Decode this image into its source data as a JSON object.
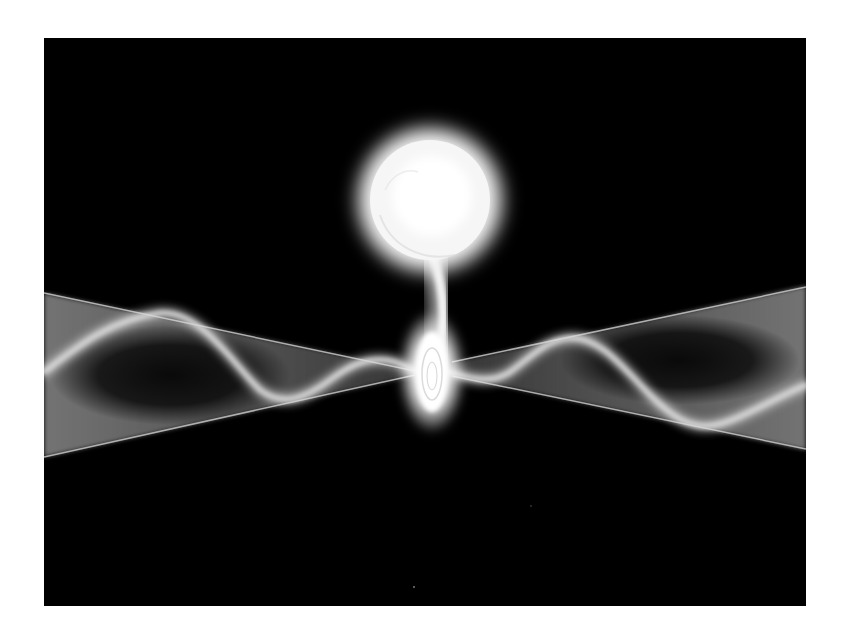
{
  "figure": {
    "background_color": "#ffffff",
    "panel_color": "#000000",
    "glow_color": "#ffffff",
    "jet_color": "#bfbfbf",
    "elements": {
      "star": "donor-star",
      "stream": "mass-transfer-stream",
      "disk": "accretion-disk",
      "left_jet": "left-jet-cone",
      "right_jet": "right-jet-cone"
    }
  }
}
